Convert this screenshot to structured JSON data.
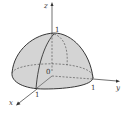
{
  "figure": {
    "colors": {
      "surface_fill": "#d6d6d6",
      "base_fill": "#e4e4e4",
      "outline": "#222222",
      "dashed": "#444444",
      "axis": "#333333"
    },
    "axes": {
      "z": {
        "label": "z",
        "tick_label": "1"
      },
      "y": {
        "label": "y",
        "tick_label": "1"
      },
      "x": {
        "label": "x",
        "tick_label": "1"
      }
    },
    "origin_label": "0"
  }
}
